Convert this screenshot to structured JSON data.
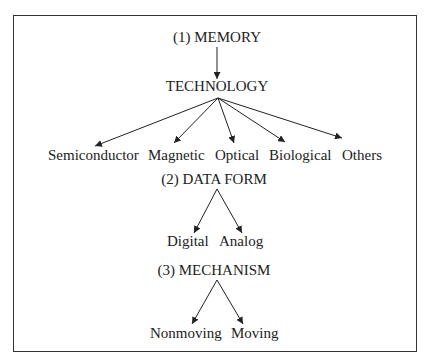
{
  "diagram": {
    "sections": [
      {
        "title": "(1) MEMORY",
        "child": "TECHNOLOGY",
        "leaves": [
          "Semiconductor",
          "Magnetic",
          "Optical",
          "Biological",
          "Others"
        ]
      },
      {
        "title": "(2) DATA FORM",
        "leaves": [
          "Digital",
          "Analog"
        ]
      },
      {
        "title": "(3) MECHANISM",
        "leaves": [
          "Nonmoving",
          "Moving"
        ]
      }
    ],
    "colors": {
      "line": "#222222",
      "border": "#333333",
      "background": "#ffffff"
    }
  }
}
